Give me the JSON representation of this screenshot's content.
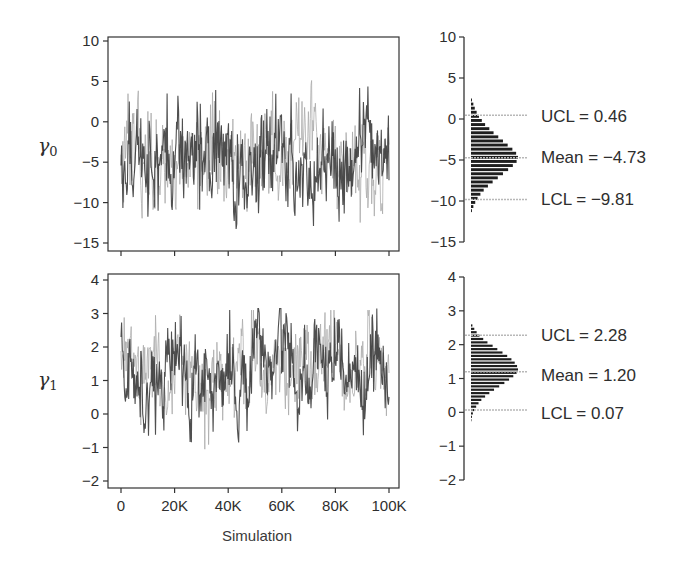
{
  "chart_data": [
    {
      "type": "line",
      "panel": "trace",
      "parameter": "γ0",
      "param_symbol": "γ",
      "param_subscript": "0",
      "xlabel": "",
      "ylabel": "γ0",
      "xlim": [
        0,
        100000
      ],
      "ylim": [
        -16,
        10
      ],
      "yticks": [
        10,
        5,
        0,
        -5,
        -10,
        -15
      ],
      "ytick_labels": [
        "10",
        "5",
        "0",
        "−5",
        "−10",
        "−15"
      ],
      "xticks": [
        0,
        20000,
        40000,
        60000,
        80000,
        100000
      ],
      "xtick_labels": [
        "",
        "",
        "",
        "",
        "",
        ""
      ],
      "series": [
        {
          "name": "chain 1",
          "color": "#3c3c3c",
          "mean": -4.73,
          "sd": 2.6,
          "range": [
            -14.2,
            4.5
          ]
        },
        {
          "name": "chain 2",
          "color": "#a9a9a9",
          "mean": -4.73,
          "sd": 2.6,
          "range": [
            -13.5,
            5.5
          ]
        }
      ],
      "grid": false
    },
    {
      "type": "bar",
      "panel": "histogram",
      "parameter": "γ0",
      "orientation": "horizontal",
      "ylim": [
        -15,
        10
      ],
      "yticks": [
        10,
        5,
        0,
        -5,
        -10,
        -15
      ],
      "ytick_labels": [
        "10",
        "5",
        "0",
        "−5",
        "−10",
        "−15"
      ],
      "bin_centers": [
        2.25,
        1.75,
        1.25,
        0.75,
        0.25,
        -0.25,
        -0.75,
        -1.25,
        -1.75,
        -2.25,
        -2.75,
        -3.25,
        -3.75,
        -4.25,
        -4.75,
        -5.25,
        -5.75,
        -6.25,
        -6.75,
        -7.25,
        -7.75,
        -8.25,
        -8.75,
        -9.25,
        -9.75,
        -10.25,
        -10.75,
        -11.25
      ],
      "counts": [
        0.02,
        0.05,
        0.08,
        0.12,
        0.17,
        0.23,
        0.3,
        0.39,
        0.48,
        0.58,
        0.68,
        0.78,
        0.88,
        0.96,
        1.0,
        0.97,
        0.89,
        0.79,
        0.68,
        0.57,
        0.46,
        0.36,
        0.27,
        0.2,
        0.14,
        0.09,
        0.05,
        0.02
      ],
      "reference_lines": [
        {
          "name": "UCL",
          "value": 0.46,
          "label": "UCL = 0.46"
        },
        {
          "name": "Mean",
          "value": -4.73,
          "label": "Mean = −4.73"
        },
        {
          "name": "LCL",
          "value": -9.81,
          "label": "LCL = −9.81"
        }
      ]
    },
    {
      "type": "line",
      "panel": "trace",
      "parameter": "γ1",
      "param_symbol": "γ",
      "param_subscript": "1",
      "xlabel": "Simulation",
      "ylabel": "γ1",
      "xlim": [
        0,
        100000
      ],
      "ylim": [
        -2.1,
        4.1
      ],
      "yticks": [
        4,
        3,
        2,
        1,
        0,
        -1,
        -2
      ],
      "ytick_labels": [
        "4",
        "3",
        "2",
        "1",
        "0",
        "−1",
        "−2"
      ],
      "xticks": [
        0,
        20000,
        40000,
        60000,
        80000,
        100000
      ],
      "xtick_labels": [
        "0",
        "20K",
        "40K",
        "60K",
        "80K",
        "100K"
      ],
      "series": [
        {
          "name": "chain 1",
          "color": "#3c3c3c",
          "mean": 1.2,
          "sd": 0.55,
          "range": [
            -0.85,
            3.15
          ]
        },
        {
          "name": "chain 2",
          "color": "#a9a9a9",
          "mean": 1.2,
          "sd": 0.55,
          "range": [
            -1.05,
            3.1
          ]
        }
      ],
      "grid": false
    },
    {
      "type": "bar",
      "panel": "histogram",
      "parameter": "γ1",
      "orientation": "horizontal",
      "ylim": [
        -2,
        4
      ],
      "yticks": [
        4,
        3,
        2,
        1,
        0,
        -1,
        -2
      ],
      "ytick_labels": [
        "4",
        "3",
        "2",
        "1",
        "0",
        "−1",
        "−2"
      ],
      "bin_centers": [
        2.55,
        2.45,
        2.35,
        2.25,
        2.15,
        2.05,
        1.95,
        1.85,
        1.75,
        1.65,
        1.55,
        1.45,
        1.35,
        1.25,
        1.15,
        1.05,
        0.95,
        0.85,
        0.75,
        0.65,
        0.55,
        0.45,
        0.35,
        0.25,
        0.15,
        0.05,
        -0.05,
        -0.15,
        -0.25
      ],
      "counts": [
        0.03,
        0.07,
        0.12,
        0.18,
        0.26,
        0.35,
        0.46,
        0.56,
        0.67,
        0.77,
        0.86,
        0.93,
        0.98,
        1.0,
        0.97,
        0.9,
        0.81,
        0.71,
        0.6,
        0.49,
        0.39,
        0.3,
        0.22,
        0.16,
        0.11,
        0.07,
        0.04,
        0.02,
        0.01
      ],
      "reference_lines": [
        {
          "name": "UCL",
          "value": 2.28,
          "label": "UCL = 2.28"
        },
        {
          "name": "Mean",
          "value": 1.2,
          "label": "Mean = 1.20"
        },
        {
          "name": "LCL",
          "value": 0.07,
          "label": "LCL = 0.07"
        }
      ]
    }
  ],
  "labels": {
    "gamma0_symbol": "γ",
    "gamma0_sub": "0",
    "gamma1_symbol": "γ",
    "gamma1_sub": "1",
    "xlabel": "Simulation",
    "top_ucl": "UCL = 0.46",
    "top_mean": "Mean = −4.73",
    "top_lcl": "LCL = −9.81",
    "bot_ucl": "UCL = 2.28",
    "bot_mean": "Mean = 1.20",
    "bot_lcl": "LCL = 0.07"
  },
  "colors": {
    "axis": "#333333",
    "dark_series": "#3c3c3c",
    "light_series": "#a9a9a9",
    "histogram": "#1e1e1e",
    "reference_line": "#b8b8b8"
  }
}
